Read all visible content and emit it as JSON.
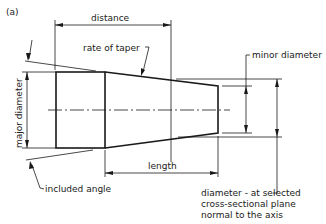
{
  "figure": {
    "label": "(a)"
  },
  "labels": {
    "distance": "distance",
    "rate_of_taper": "rate of taper",
    "minor_diameter": "minor diameter",
    "major_diameter": "major diameter",
    "length": "length",
    "included_angle": "included angle",
    "selected_diameter_line1": "diameter - at selected",
    "selected_diameter_line2": "cross-sectional plane",
    "selected_diameter_line3": "normal to the axis"
  },
  "colors": {
    "line": "#1a1a1a",
    "background": "#ffffff"
  }
}
